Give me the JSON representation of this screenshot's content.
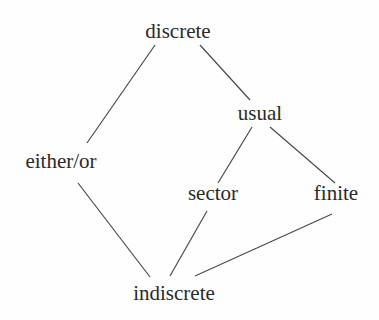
{
  "diagram": {
    "type": "hasse-diagram",
    "nodes": [
      {
        "id": "discrete",
        "label": "discrete",
        "x": 178,
        "y": 38
      },
      {
        "id": "usual",
        "label": "usual",
        "x": 260,
        "y": 120
      },
      {
        "id": "either_or",
        "label": "either/or",
        "x": 61,
        "y": 168
      },
      {
        "id": "sector",
        "label": "sector",
        "x": 213,
        "y": 200
      },
      {
        "id": "finite",
        "label": "finite",
        "x": 336,
        "y": 200
      },
      {
        "id": "indiscrete",
        "label": "indiscrete",
        "x": 174,
        "y": 300
      }
    ],
    "edges": [
      {
        "from": "discrete",
        "to": "either_or",
        "x1": 155,
        "y1": 45,
        "x2": 87,
        "y2": 143
      },
      {
        "from": "discrete",
        "to": "usual",
        "x1": 200,
        "y1": 45,
        "x2": 250,
        "y2": 100
      },
      {
        "from": "usual",
        "to": "sector",
        "x1": 252,
        "y1": 127,
        "x2": 218,
        "y2": 183
      },
      {
        "from": "usual",
        "to": "finite",
        "x1": 270,
        "y1": 127,
        "x2": 335,
        "y2": 183
      },
      {
        "from": "either_or",
        "to": "indiscrete",
        "x1": 78,
        "y1": 183,
        "x2": 150,
        "y2": 277
      },
      {
        "from": "sector",
        "to": "indiscrete",
        "x1": 207,
        "y1": 211,
        "x2": 170,
        "y2": 276
      },
      {
        "from": "finite",
        "to": "indiscrete",
        "x1": 332,
        "y1": 214,
        "x2": 195,
        "y2": 276
      }
    ]
  }
}
